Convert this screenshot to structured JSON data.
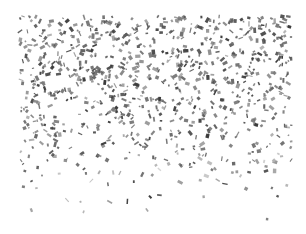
{
  "image": {
    "subject": "confetti falling",
    "background_color": "#ffffff",
    "confetti_colors": [
      "#3a3a3a",
      "#4d4d4d",
      "#5e5e5e",
      "#7a7a7a",
      "#999999",
      "#b5b5b5"
    ],
    "region": {
      "left": 20,
      "top": 16,
      "right": 292,
      "bottom": 225
    },
    "density": {
      "top_band_end": 120,
      "fade_end": 225
    }
  }
}
